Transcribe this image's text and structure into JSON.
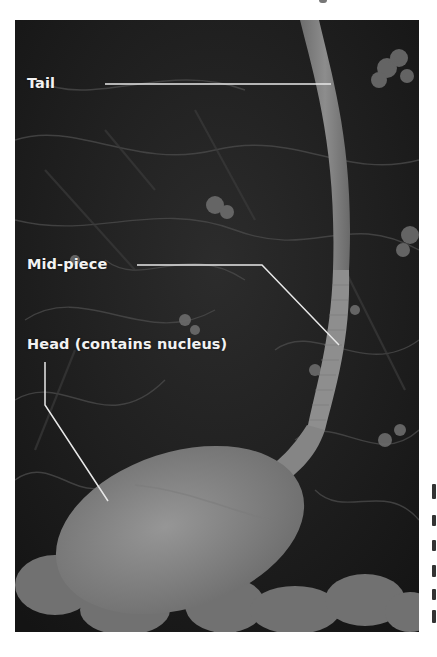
{
  "figure": {
    "labels": [
      {
        "id": "tail",
        "text": "Tail"
      },
      {
        "id": "mid-piece",
        "text": "Mid-piece"
      },
      {
        "id": "head",
        "text": "Head (contains nucleus)"
      }
    ]
  },
  "colors": {
    "background": "#ffffff",
    "photo_dark": "#1b1b1b",
    "cell_gray": "#8a8a8a",
    "label_text": "#f2f2f2",
    "leader_line": "#e8e8e8"
  }
}
